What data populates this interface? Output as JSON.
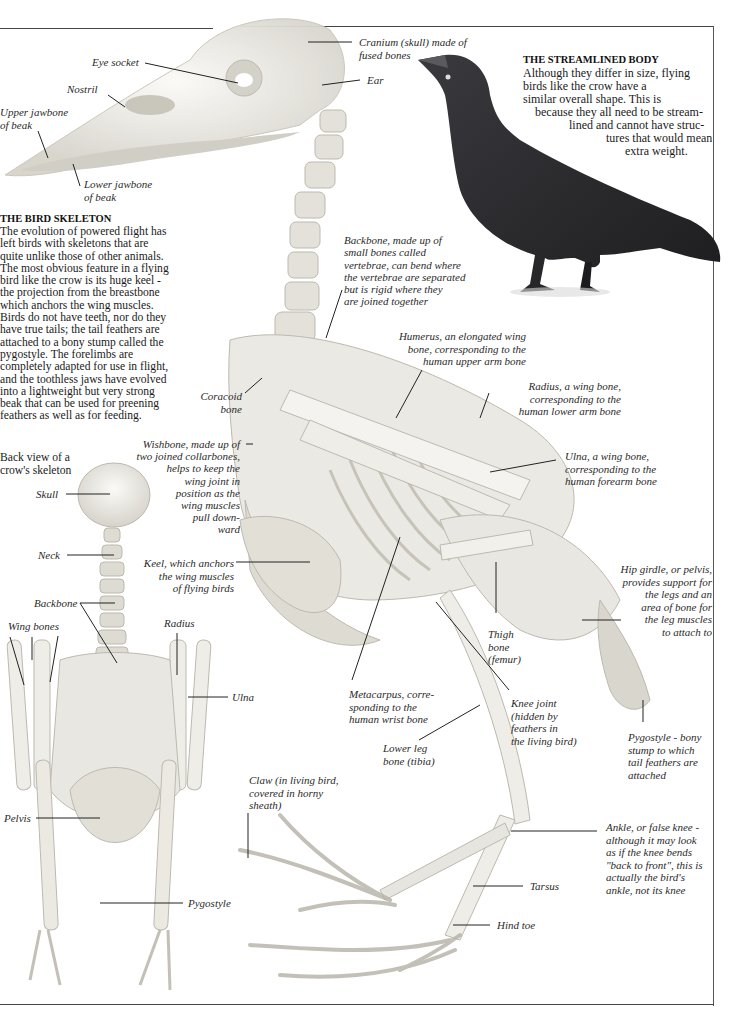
{
  "streamlined_body": {
    "heading": "THE STREAMLINED BODY",
    "lines": [
      "Although they differ in size, flying",
      "birds like the crow have a",
      "similar overall shape. This is",
      "because they all need to be stream-",
      "lined and cannot have struc-",
      "tures that would mean",
      "extra weight."
    ]
  },
  "bird_skeleton": {
    "heading": "THE BIRD SKELETON",
    "text": "The evolution of powered flight has left birds with skeletons that are quite unlike those of other animals. The most obvious feature in a flying bird like the crow is its huge keel - the projection from the breastbone which anchors the wing muscles. Birds do not have teeth, nor do they have true tails; the tail feathers are attached to a bony stump called the pygostyle. The forelimbs are completely adapted for use in flight, and the toothless jaws have evolved into a lightweight but very strong beak that can be used for preening feathers as well as for feeding."
  },
  "back_view_caption": "Back view of a\ncrow's skeleton",
  "labels": {
    "eye_socket": "Eye socket",
    "nostril": "Nostril",
    "upper_jawbone": "Upper jawbone\nof beak",
    "lower_jawbone": "Lower jawbone\nof beak",
    "cranium": "Cranium (skull) made of\nfused bones",
    "ear": "Ear",
    "backbone_side": "Backbone, made up of\nsmall bones called\nvertebrae, can bend where\nthe vertebrae are separated\nbut is rigid where they\nare joined together",
    "humerus": "Humerus, an elongated wing\nbone, corresponding to the\nhuman upper arm bone",
    "radius_side": "Radius, a wing bone,\ncorresponding to the\nhuman lower arm bone",
    "coracoid": "Coracoid\nbone",
    "wishbone": "Wishbone, made up of\ntwo joined collarbones,\nhelps to keep the\nwing joint in\nposition as the\nwing muscles\npull down-\nward",
    "ulna_side": "Ulna, a wing bone,\ncorresponding to the\nhuman forearm bone",
    "keel": "Keel, which anchors\nthe wing muscles\nof flying birds",
    "hip_girdle": "Hip girdle, or pelvis,\nprovides support for\nthe legs and an\narea of bone for\nthe leg muscles\nto attach to",
    "thigh_bone": "Thigh\nbone\n(femur)",
    "metacarpus": "Metacarpus, corre-\nsponding to the\nhuman wrist bone",
    "knee_joint": "Knee joint\n(hidden by\nfeathers in\nthe living bird)",
    "lower_leg": "Lower leg\nbone (tibia)",
    "pygostyle_side": "Pygostyle - bony\nstump to which\ntail feathers are\nattached",
    "claw": "Claw (in living bird,\ncovered in horny\nsheath)",
    "ankle": "Ankle, or false knee -\nalthough it may look\nas if the knee bends\n\"back to front\", this is\nactually the bird's\nankle, not its knee",
    "tarsus": "Tarsus",
    "hind_toe": "Hind toe",
    "skull_back": "Skull",
    "neck_back": "Neck",
    "backbone_back": "Backbone",
    "wing_bones_back": "Wing bones",
    "radius_back": "Radius",
    "ulna_back": "Ulna",
    "pelvis_back": "Pelvis",
    "pygostyle_back": "Pygostyle"
  },
  "colors": {
    "bone": "#ecebe6",
    "bone_shadow": "#b9b6ad",
    "crow": "#2b2b2e",
    "rule": "#444444"
  }
}
